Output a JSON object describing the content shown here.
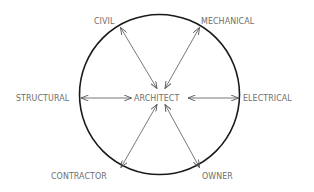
{
  "diagram": {
    "title": "",
    "center_node": {
      "label": "ARCHITECT"
    },
    "nodes": [
      {
        "id": "civil",
        "label": "CIVIL",
        "position": "top-left"
      },
      {
        "id": "mechanical",
        "label": "MECHANICAL",
        "position": "top-right"
      },
      {
        "id": "structural",
        "label": "STRUCTURAL",
        "position": "left"
      },
      {
        "id": "electrical",
        "label": "ELECTRICAL",
        "position": "right"
      },
      {
        "id": "contractor",
        "label": "CONTRACTOR",
        "position": "bottom-left"
      },
      {
        "id": "owner",
        "label": "OWNER",
        "position": "bottom-right"
      }
    ],
    "edges": [
      {
        "from": "ARCHITECT",
        "to": "CIVIL",
        "type": "bidirectional"
      },
      {
        "from": "ARCHITECT",
        "to": "MECHANICAL",
        "type": "bidirectional"
      },
      {
        "from": "ARCHITECT",
        "to": "STRUCTURAL",
        "type": "bidirectional"
      },
      {
        "from": "ARCHITECT",
        "to": "ELECTRICAL",
        "type": "bidirectional"
      },
      {
        "from": "ARCHITECT",
        "to": "CONTRACTOR",
        "type": "bidirectional"
      },
      {
        "from": "ARCHITECT",
        "to": "OWNER",
        "type": "bidirectional"
      }
    ],
    "colors": {
      "circle": "#1a1a1a",
      "arrow": "#555555",
      "text": "#6e6e6e",
      "background": "#ffffff"
    }
  }
}
